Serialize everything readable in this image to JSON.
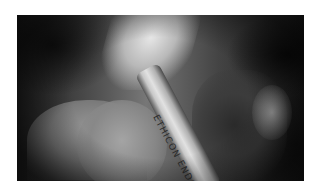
{
  "image": {
    "type": "laparoscopic surgical photograph (grayscale)",
    "instrument_label": "ETHICON ENDO",
    "colors": {
      "border": "#ffffff",
      "dark_corner": "#101010",
      "tissue_mid": "#888888",
      "highlight": "#e6e6e6",
      "instrument": "#d0d0d0"
    }
  }
}
